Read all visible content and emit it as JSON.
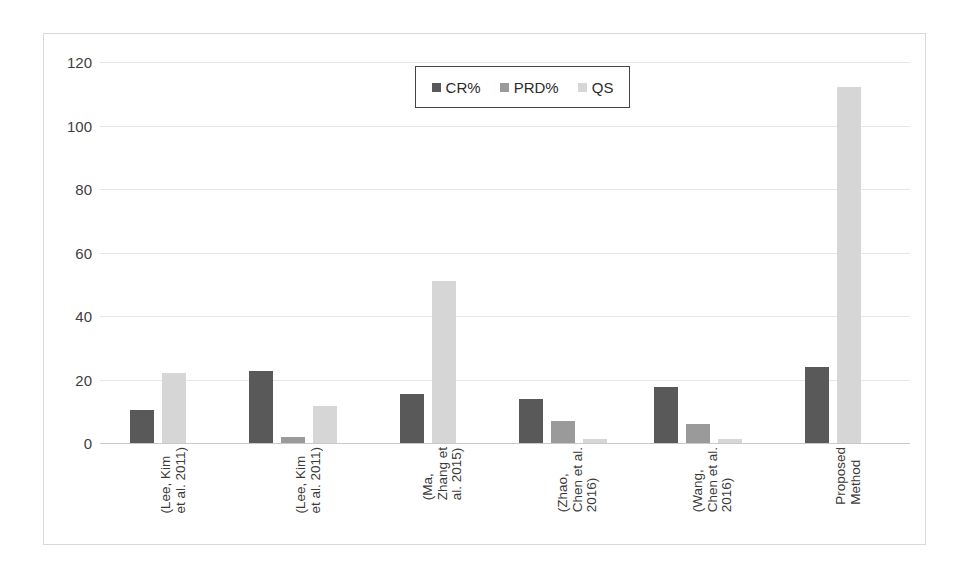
{
  "chart_data": {
    "type": "bar",
    "title": "",
    "xlabel": "",
    "ylabel": "",
    "ylim": [
      0,
      120
    ],
    "yticks": [
      0,
      20,
      40,
      60,
      80,
      100,
      120
    ],
    "grid": true,
    "legend_position": "top-center",
    "categories": [
      "(Lee, Kim et al. 2011)",
      "(Lee, Kim et al. 2011)",
      "(Ma, Zhang et al. 2015)",
      "(Zhao, Chen et al. 2016)",
      "(Wang, Chen et al. 2016)",
      "Proposed Method"
    ],
    "category_lines": [
      [
        "(Lee, Kim",
        "et al. 2011)"
      ],
      [
        "(Lee, Kim",
        "et al. 2011)"
      ],
      [
        "(Ma,",
        "Zhang et",
        "al. 2015)"
      ],
      [
        "(Zhao,",
        "Chen et al.",
        "2016)"
      ],
      [
        "(Wang,",
        "Chen et al.",
        "2016)"
      ],
      [
        "Proposed",
        "Method"
      ]
    ],
    "series": [
      {
        "name": "CR%",
        "color": "#595959",
        "values": [
          10.5,
          22.7,
          15.4,
          14.0,
          17.5,
          24.0
        ]
      },
      {
        "name": "PRD%",
        "color": "#9a9a9a",
        "values": [
          0,
          2.0,
          0,
          6.8,
          6.0,
          0
        ]
      },
      {
        "name": "QS",
        "color": "#d6d6d6",
        "values": [
          22.0,
          11.8,
          51.0,
          1.3,
          1.3,
          112.0
        ]
      }
    ]
  },
  "legend": {
    "items": [
      {
        "label": "CR%",
        "swatch": "cr"
      },
      {
        "label": "PRD%",
        "swatch": "prd"
      },
      {
        "label": "QS",
        "swatch": "qs"
      }
    ]
  },
  "colors": {
    "cr": "#595959",
    "prd": "#9a9a9a",
    "qs": "#d6d6d6",
    "grid": "#e6e6e6",
    "border": "#d9d9d9",
    "text": "#404040"
  }
}
